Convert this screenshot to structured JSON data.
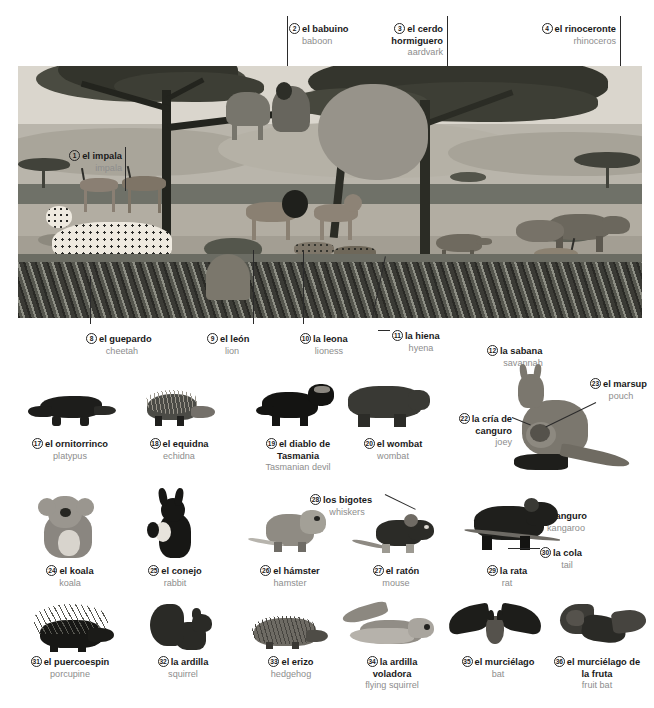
{
  "page": {
    "kind": "bilingual-picture-dictionary",
    "languages": [
      "Spanish",
      "English"
    ]
  },
  "colors": {
    "label_es": "#1a1a1a",
    "label_en": "#8d8d8d",
    "leader_line": "#2b2b2b",
    "sky": "#dad6cd",
    "ridge": "#b9b5ab",
    "band": "#6f7168",
    "plain": "#b2ada2",
    "grass": "#6b6c63",
    "tree": "#3a3b33"
  },
  "scene": {
    "name": "savannah-scene",
    "labels": [
      {
        "num": "1",
        "es": "el impala",
        "en": "impala"
      },
      {
        "num": "2",
        "es": "el babuino",
        "en": "baboon"
      },
      {
        "num": "3",
        "es": "el cerdo hormiguero",
        "en": "aardvark"
      },
      {
        "num": "4",
        "es": "el rinoceronte",
        "en": "rhinoceros"
      },
      {
        "num": "8",
        "es": "el guepardo",
        "en": "cheetah"
      },
      {
        "num": "9",
        "es": "el león",
        "en": "lion"
      },
      {
        "num": "10",
        "es": "la leona",
        "en": "lioness"
      },
      {
        "num": "11",
        "es": "la hiena",
        "en": "hyena"
      },
      {
        "num": "12",
        "es": "la sabana",
        "en": "savannah"
      }
    ]
  },
  "rows": [
    {
      "name": "row-marsupials-monotremes",
      "items": [
        {
          "num": "17",
          "es": "el ornitorrinco",
          "en": "platypus"
        },
        {
          "num": "18",
          "es": "el equidna",
          "en": "echidna"
        },
        {
          "num": "19",
          "es": "el diablo de Tasmania",
          "en": "Tasmanian devil"
        },
        {
          "num": "20",
          "es": "el wombat",
          "en": "wombat"
        },
        {
          "num": "21",
          "es": "el canguro",
          "en": "kangaroo"
        },
        {
          "num": "22",
          "es": "la cría de canguro",
          "en": "joey"
        },
        {
          "num": "23",
          "es": "el marsup",
          "en": "pouch"
        }
      ]
    },
    {
      "name": "row-small-mammals",
      "items": [
        {
          "num": "24",
          "es": "el koala",
          "en": "koala"
        },
        {
          "num": "25",
          "es": "el conejo",
          "en": "rabbit"
        },
        {
          "num": "26",
          "es": "el hámster",
          "en": "hamster"
        },
        {
          "num": "27",
          "es": "el ratón",
          "en": "mouse"
        },
        {
          "num": "28",
          "es": "los bigotes",
          "en": "whiskers"
        },
        {
          "num": "29",
          "es": "la rata",
          "en": "rat"
        },
        {
          "num": "30",
          "es": "la cola",
          "en": "tail"
        }
      ]
    },
    {
      "name": "row-rodents-bats",
      "items": [
        {
          "num": "31",
          "es": "el puercoespin",
          "en": "porcupine"
        },
        {
          "num": "32",
          "es": "la ardilla",
          "en": "squirrel"
        },
        {
          "num": "33",
          "es": "el erizo",
          "en": "hedgehog"
        },
        {
          "num": "34",
          "es": "la ardilla voladora",
          "en": "flying squirrel"
        },
        {
          "num": "35",
          "es": "el murciélago",
          "en": "bat"
        },
        {
          "num": "36",
          "es": "el murciélago de la fruta",
          "en": "fruit bat"
        }
      ]
    }
  ]
}
